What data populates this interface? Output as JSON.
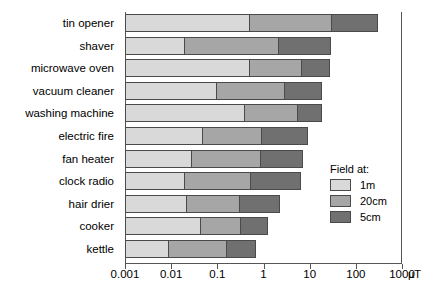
{
  "chart_data": {
    "type": "bar",
    "orientation": "horizontal",
    "stacked": true,
    "title": "",
    "subtitle": "",
    "xlabel": "",
    "ylabel": "",
    "unit": "µT",
    "xscale": "log",
    "xlim": [
      0.001,
      1000
    ],
    "grid": false,
    "legend_position": "inside-right",
    "legend_title": "Field at:",
    "xticks": [
      0.001,
      0.01,
      0.1,
      1,
      10,
      100,
      1000
    ],
    "xtick_labels": [
      "0.001",
      "0.01",
      "0.1",
      "1",
      "10",
      "100",
      "1000"
    ],
    "categories": [
      "tin opener",
      "shaver",
      "microwave oven",
      "vacuum cleaner",
      "washing machine",
      "electric fire",
      "fan heater",
      "clock radio",
      "hair drier",
      "cooker",
      "kettle"
    ],
    "series": [
      {
        "name": "1m",
        "color": "#d9d9d9",
        "values": [
          0.5,
          0.02,
          0.5,
          0.1,
          0.4,
          0.05,
          0.028,
          0.02,
          0.022,
          0.045,
          0.009
        ]
      },
      {
        "name": "20cm",
        "color": "#a6a6a6",
        "values": [
          32,
          2.3,
          7.0,
          3.0,
          6.0,
          1.0,
          0.95,
          0.55,
          0.33,
          0.35,
          0.17
        ]
      },
      {
        "name": "5cm",
        "color": "#707070",
        "values": [
          340,
          32,
          30,
          20,
          20,
          10,
          8.0,
          7.0,
          2.5,
          1.4,
          0.75
        ]
      }
    ]
  },
  "legend": {
    "title": "Field at:",
    "entries": [
      {
        "label": "1m",
        "color": "#d9d9d9"
      },
      {
        "label": "20cm",
        "color": "#a6a6a6"
      },
      {
        "label": "5cm",
        "color": "#707070"
      }
    ]
  },
  "axis": {
    "unit_label": "µT"
  }
}
